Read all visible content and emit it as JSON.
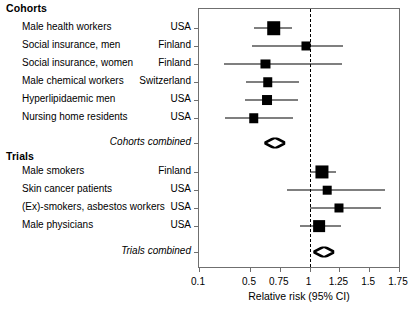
{
  "figure": {
    "x_axis": {
      "title": "Relative risk (95% CI)",
      "ticks": [
        "0.1",
        "0.5",
        "0.75",
        "1",
        "1.25",
        "1.5",
        "1.75"
      ],
      "null_value": "1"
    },
    "groups": [
      {
        "heading": "Cohorts"
      },
      {
        "heading": "Trials"
      }
    ],
    "summary_labels": {
      "cohorts": "Cohorts combined",
      "trials": "Trials combined"
    },
    "rows": [
      {
        "name": "Male health workers",
        "country": "USA"
      },
      {
        "name": "Social insurance, men",
        "country": "Finland"
      },
      {
        "name": "Social insurance, women",
        "country": "Finland"
      },
      {
        "name": "Male chemical workers",
        "country": "Switzerland"
      },
      {
        "name": "Hyperlipidaemic men",
        "country": "USA"
      },
      {
        "name": "Nursing home residents",
        "country": "USA"
      },
      {
        "name": "Male smokers",
        "country": "Finland"
      },
      {
        "name": "Skin cancer patients",
        "country": "USA"
      },
      {
        "name": "(Ex)-smokers, asbestos workers",
        "country": "USA"
      },
      {
        "name": "Male physicians",
        "country": "USA"
      }
    ]
  },
  "chart_data": {
    "type": "forest",
    "title": "",
    "xlabel": "Relative risk (95% CI)",
    "ylabel": "",
    "xticks": [
      0.1,
      0.5,
      0.75,
      1,
      1.25,
      1.5,
      1.75
    ],
    "xlim": [
      0.1,
      1.75
    ],
    "null_line": 1,
    "grid": false,
    "legend": "none",
    "groups": [
      {
        "name": "Cohorts",
        "studies": [
          {
            "label": "Male health workers",
            "country": "USA",
            "rr": 0.7,
            "ci_low": 0.53,
            "ci_high": 0.85,
            "weight": 0.95
          },
          {
            "label": "Social insurance, men",
            "country": "Finland",
            "rr": 0.97,
            "ci_low": 0.52,
            "ci_high": 1.28,
            "weight": 0.45
          },
          {
            "label": "Social insurance, women",
            "country": "Finland",
            "rr": 0.63,
            "ci_low": 0.28,
            "ci_high": 1.27,
            "weight": 0.45
          },
          {
            "label": "Male chemical workers",
            "country": "Switzerland",
            "rr": 0.65,
            "ci_low": 0.47,
            "ci_high": 0.91,
            "weight": 0.5
          },
          {
            "label": "Hyperlipidaemic men",
            "country": "USA",
            "rr": 0.64,
            "ci_low": 0.46,
            "ci_high": 0.9,
            "weight": 0.55
          },
          {
            "label": "Nursing home residents",
            "country": "USA",
            "rr": 0.53,
            "ci_low": 0.29,
            "ci_high": 0.86,
            "weight": 0.5
          }
        ],
        "summary": {
          "label": "Cohorts combined",
          "rr": 0.71,
          "ci_low": 0.62,
          "ci_high": 0.8
        }
      },
      {
        "name": "Trials",
        "studies": [
          {
            "label": "Male smokers",
            "country": "Finland",
            "rr": 1.1,
            "ci_low": 1.0,
            "ci_high": 1.22,
            "weight": 0.9
          },
          {
            "label": "Skin cancer patients",
            "country": "USA",
            "rr": 1.15,
            "ci_low": 0.81,
            "ci_high": 1.63,
            "weight": 0.4
          },
          {
            "label": "(Ex)-smokers, asbestos workers",
            "country": "USA",
            "rr": 1.25,
            "ci_low": 1.0,
            "ci_high": 1.6,
            "weight": 0.45
          },
          {
            "label": "Male physicians",
            "country": "USA",
            "rr": 1.08,
            "ci_low": 0.92,
            "ci_high": 1.26,
            "weight": 0.75
          }
        ],
        "summary": {
          "label": "Trials combined",
          "rr": 1.12,
          "ci_low": 1.02,
          "ci_high": 1.2
        }
      }
    ]
  }
}
